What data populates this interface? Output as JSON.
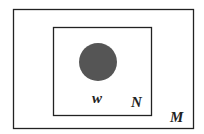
{
  "diagram": {
    "type": "set-nesting",
    "outer_set": {
      "label": "M",
      "stroke": "#222222"
    },
    "inner_set": {
      "label": "N",
      "stroke": "#222222"
    },
    "element": {
      "label": "w",
      "fill": "#555555"
    }
  }
}
